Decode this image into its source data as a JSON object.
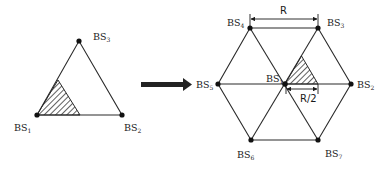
{
  "left_diagram": {
    "nodes": [
      {
        "id": "BS1",
        "label": "BS",
        "sub": "1"
      },
      {
        "id": "BS2",
        "label": "BS",
        "sub": "2"
      },
      {
        "id": "BS3",
        "label": "BS",
        "sub": "3"
      }
    ],
    "shape": "equilateral-triangle",
    "hatched_region": "corner sub-triangle at BS1"
  },
  "arrow": {
    "icon": "right-arrow-icon",
    "color": "#222222"
  },
  "right_diagram": {
    "nodes": [
      {
        "id": "BS1",
        "label": "BS",
        "sub": "1"
      },
      {
        "id": "BS2",
        "label": "BS",
        "sub": "2"
      },
      {
        "id": "BS3",
        "label": "BS",
        "sub": "3"
      },
      {
        "id": "BS4",
        "label": "BS",
        "sub": "4"
      },
      {
        "id": "BS5",
        "label": "BS",
        "sub": "5"
      },
      {
        "id": "BS6",
        "label": "BS",
        "sub": "6"
      },
      {
        "id": "BS7",
        "label": "BS",
        "sub": "7"
      }
    ],
    "shape": "hexagon-of-six-triangles",
    "dimensions": {
      "top": "R",
      "inner": "R/2"
    },
    "hatched_region": "half-triangle between BS1 and BS2/BS3"
  },
  "colors": {
    "line": "#2a2a2a",
    "node": "#111111",
    "background": "#ffffff"
  }
}
